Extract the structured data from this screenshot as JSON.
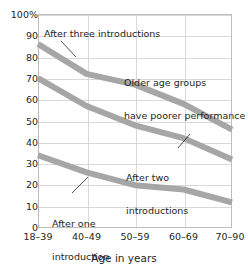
{
  "chart_data": {
    "type": "line",
    "title": "",
    "xlabel": "Age in years",
    "ylabel": "",
    "categories": [
      "18–39",
      "40–49",
      "50–59",
      "60–69",
      "70–90"
    ],
    "ylim": [
      0,
      100
    ],
    "yticks": [
      "100%",
      "90",
      "80",
      "70",
      "60",
      "50",
      "40",
      "30",
      "20",
      "10",
      "0"
    ],
    "ytick_values": [
      100,
      90,
      80,
      70,
      60,
      50,
      40,
      30,
      20,
      10,
      0
    ],
    "grid": true,
    "legend_position": "none",
    "series": [
      {
        "name": "After three introductions",
        "values": [
          86,
          72,
          67,
          58,
          46
        ],
        "color": "#a6a6a6"
      },
      {
        "name": "After two introductions",
        "values": [
          70,
          57,
          48,
          42,
          32
        ],
        "color": "#a6a6a6"
      },
      {
        "name": "After one introduction",
        "values": [
          34,
          26,
          20,
          18,
          12
        ],
        "color": "#a6a6a6"
      }
    ],
    "annotations": [
      {
        "id": "three",
        "text": "After three introductions"
      },
      {
        "id": "older",
        "text": "Older age groups\nhave poorer performance"
      },
      {
        "id": "two",
        "text": "After two\nintroductions"
      },
      {
        "id": "one",
        "text": "After one\nintroduction"
      }
    ]
  },
  "axis": {
    "x_label": "Age in years",
    "x_ticks": [
      "18–39",
      "40–49",
      "50–59",
      "60–69",
      "70–90"
    ],
    "y_ticks": [
      "100%",
      "90",
      "80",
      "70",
      "60",
      "50",
      "40",
      "30",
      "20",
      "10",
      "0"
    ]
  },
  "annotations": {
    "three_introductions": "After three introductions",
    "older_line1": "Older age groups",
    "older_line2": "have poorer performance",
    "two_line1": "After two",
    "two_line2": "introductions",
    "one_line1": "After one",
    "one_line2": "introduction"
  },
  "colors": {
    "series": "#a6a6a6",
    "grid": "#d9d9d9",
    "frame": "#bdbdbd",
    "text": "#231f20",
    "leader": "#231f20",
    "background": "#ffffff"
  }
}
